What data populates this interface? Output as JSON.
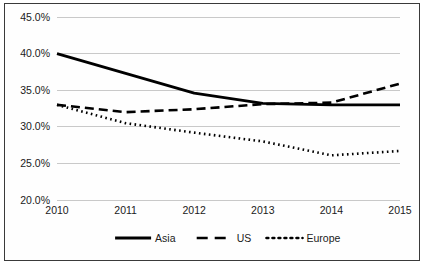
{
  "chart_data": {
    "type": "line",
    "title": "",
    "xlabel": "",
    "ylabel": "",
    "x": [
      2010,
      2011,
      2012,
      2013,
      2014,
      2015
    ],
    "categories": [
      "2010",
      "2011",
      "2012",
      "2013",
      "2014",
      "2015"
    ],
    "xtick_labels": [
      "2010",
      "2011",
      "2012",
      "2013",
      "2014",
      "2015"
    ],
    "ytick_labels": [
      "45.0%",
      "40.0%",
      "35.0%",
      "30.0%",
      "25.0%",
      "20.0%"
    ],
    "ytick_values": [
      45.0,
      40.0,
      35.0,
      30.0,
      25.0,
      20.0
    ],
    "ylim": [
      20.0,
      45.0
    ],
    "xlim": [
      2010,
      2015
    ],
    "grid": true,
    "grid_axis": "y",
    "legend_position": "bottom",
    "value_suffix": "%",
    "series": [
      {
        "name": "Asia",
        "style": "solid",
        "color": "#000000",
        "values": [
          40.0,
          37.3,
          34.6,
          33.2,
          33.0,
          33.0
        ]
      },
      {
        "name": "US",
        "style": "dashed",
        "color": "#000000",
        "values": [
          33.0,
          32.0,
          32.4,
          33.1,
          33.3,
          35.9
        ]
      },
      {
        "name": "Europe",
        "style": "dotted",
        "color": "#000000",
        "values": [
          33.0,
          30.5,
          29.2,
          28.0,
          26.1,
          26.7
        ]
      }
    ]
  },
  "legend": {
    "items": [
      {
        "label": "Asia",
        "style": "solid"
      },
      {
        "label": "US",
        "style": "dashed"
      },
      {
        "label": "Europe",
        "style": "dotted"
      }
    ]
  },
  "colors": {
    "ink": "#000000",
    "gridline": "#c9c9c9",
    "border": "#3a3a3a",
    "background": "#ffffff"
  }
}
